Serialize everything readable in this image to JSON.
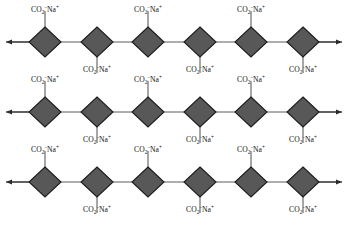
{
  "diagram": {
    "background_color": "#ffffff",
    "node_fill_color": "#585858",
    "node_stroke_color": "#1c1c1c",
    "line_color": "#4a4a4a",
    "arrow_color": "#2a2a2a",
    "text_color": "#121212",
    "label": {
      "formula": "CO2-Na+",
      "base": "CO",
      "subscript": "2",
      "charge_minus": "−",
      "cation": "Na",
      "charge_plus": "+"
    },
    "geometry": {
      "node_half_width": 16,
      "node_half_height": 15,
      "node_x_positions": [
        45,
        97,
        148,
        200,
        251,
        303
      ],
      "row_center_y": [
        42,
        112,
        182
      ],
      "stub_length_up": 16,
      "stub_length_down": 16,
      "arrow_left_x": 6,
      "arrow_right_x": 342
    },
    "rows": [
      {
        "row_index": 1,
        "name": "polymer-chain-row-1",
        "center_y": 42,
        "left_arrow": true,
        "right_arrow": true,
        "nodes": [
          {
            "index": 1,
            "x": 45,
            "label_side": "above",
            "label_y": 12
          },
          {
            "index": 2,
            "x": 97,
            "label_side": "below",
            "label_y": 72
          },
          {
            "index": 3,
            "x": 148,
            "label_side": "above",
            "label_y": 12
          },
          {
            "index": 4,
            "x": 200,
            "label_side": "below",
            "label_y": 72
          },
          {
            "index": 5,
            "x": 251,
            "label_side": "above",
            "label_y": 12
          },
          {
            "index": 6,
            "x": 303,
            "label_side": "below",
            "label_y": 72
          }
        ]
      },
      {
        "row_index": 2,
        "name": "polymer-chain-row-2",
        "center_y": 112,
        "left_arrow": true,
        "right_arrow": true,
        "nodes": [
          {
            "index": 1,
            "x": 45,
            "label_side": "above",
            "label_y": 82
          },
          {
            "index": 2,
            "x": 97,
            "label_side": "below",
            "label_y": 142
          },
          {
            "index": 3,
            "x": 148,
            "label_side": "above",
            "label_y": 82
          },
          {
            "index": 4,
            "x": 200,
            "label_side": "below",
            "label_y": 142
          },
          {
            "index": 5,
            "x": 251,
            "label_side": "above",
            "label_y": 82
          },
          {
            "index": 6,
            "x": 303,
            "label_side": "below",
            "label_y": 142
          }
        ]
      },
      {
        "row_index": 3,
        "name": "polymer-chain-row-3",
        "center_y": 182,
        "left_arrow": true,
        "right_arrow": true,
        "nodes": [
          {
            "index": 1,
            "x": 45,
            "label_side": "above",
            "label_y": 152
          },
          {
            "index": 2,
            "x": 97,
            "label_side": "below",
            "label_y": 212
          },
          {
            "index": 3,
            "x": 148,
            "label_side": "above",
            "label_y": 152
          },
          {
            "index": 4,
            "x": 200,
            "label_side": "below",
            "label_y": 212
          },
          {
            "index": 5,
            "x": 251,
            "label_side": "above",
            "label_y": 152
          },
          {
            "index": 6,
            "x": 303,
            "label_side": "below",
            "label_y": 212
          }
        ]
      }
    ]
  }
}
